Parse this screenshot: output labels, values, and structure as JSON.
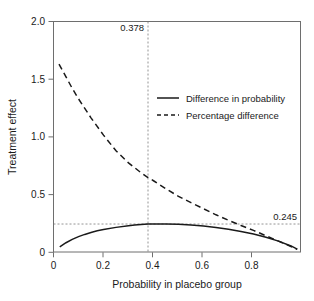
{
  "chart_data": {
    "type": "line",
    "title": "",
    "xlabel": "Probability in placebo group",
    "ylabel": "Treatment effect",
    "xlim": [
      0,
      1.0
    ],
    "ylim": [
      0,
      2.0
    ],
    "xticks": [
      0,
      0.2,
      0.4,
      0.6,
      0.8
    ],
    "xticklabels": [
      "0",
      "0.2",
      "0.4",
      "0.6",
      "0.8"
    ],
    "yticks": [
      0,
      0.5,
      1.0,
      1.5,
      2.0
    ],
    "yticklabels": [
      "0",
      "0.5",
      "1.0",
      "1.5",
      "2.0"
    ],
    "grid": false,
    "legend_position": "upper right",
    "series": [
      {
        "name": "Difference in probability",
        "style": "solid",
        "color": "#1a1a1a",
        "x": [
          0.025,
          0.05,
          0.075,
          0.1,
          0.125,
          0.15,
          0.175,
          0.2,
          0.25,
          0.3,
          0.325,
          0.35,
          0.378,
          0.4,
          0.425,
          0.45,
          0.5,
          0.55,
          0.6,
          0.65,
          0.7,
          0.75,
          0.8,
          0.85,
          0.9,
          0.95,
          0.975
        ],
        "y": [
          0.047,
          0.083,
          0.112,
          0.136,
          0.155,
          0.172,
          0.186,
          0.197,
          0.216,
          0.231,
          0.236,
          0.241,
          0.245,
          0.246,
          0.246,
          0.245,
          0.242,
          0.236,
          0.227,
          0.215,
          0.2,
          0.181,
          0.158,
          0.13,
          0.097,
          0.055,
          0.028
        ]
      },
      {
        "name": "Percentage difference",
        "style": "dashed",
        "color": "#1a1a1a",
        "x": [
          0.022,
          0.05,
          0.075,
          0.1,
          0.15,
          0.2,
          0.25,
          0.3,
          0.35,
          0.378,
          0.4,
          0.45,
          0.5,
          0.55,
          0.6,
          0.65,
          0.7,
          0.75,
          0.8,
          0.85,
          0.9,
          0.95,
          0.975
        ],
        "y": [
          1.63,
          1.52,
          1.42,
          1.33,
          1.165,
          1.015,
          0.88,
          0.775,
          0.69,
          0.648,
          0.62,
          0.55,
          0.485,
          0.43,
          0.378,
          0.325,
          0.277,
          0.232,
          0.19,
          0.143,
          0.097,
          0.05,
          0.025
        ]
      }
    ],
    "annotations": [
      {
        "id": "vline",
        "label": "0.378",
        "type": "vertical-dashed",
        "value": 0.378
      },
      {
        "id": "hline",
        "label": "0.245",
        "type": "horizontal-dashed",
        "value": 0.245
      }
    ]
  },
  "legend": {
    "items": [
      {
        "label": "Difference in probability",
        "style": "solid"
      },
      {
        "label": "Percentage difference",
        "style": "dashed"
      }
    ]
  }
}
